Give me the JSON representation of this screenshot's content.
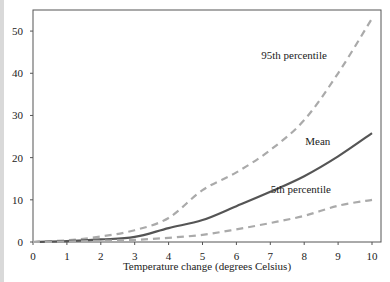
{
  "chart_data": {
    "type": "line",
    "title": "",
    "xlabel": "Temperature change (degrees Celsius)",
    "ylabel": "",
    "xlim": [
      0,
      10
    ],
    "ylim": [
      0,
      55
    ],
    "x_ticks": [
      0,
      1,
      2,
      3,
      4,
      5,
      6,
      7,
      8,
      9,
      10
    ],
    "y_ticks": [
      0,
      10,
      20,
      30,
      40,
      50
    ],
    "grid": false,
    "legend": "inline labels",
    "x": [
      0,
      1,
      2,
      3,
      4,
      5,
      6,
      7,
      8,
      9,
      10
    ],
    "series": [
      {
        "name": "95th percentile",
        "style": "dashed",
        "color": "#aaaaaa",
        "values": [
          0,
          0.4,
          1.3,
          2.8,
          5.7,
          12.3,
          16.5,
          21.8,
          28.9,
          40.0,
          53.0
        ]
      },
      {
        "name": "Mean",
        "style": "solid",
        "color": "#555555",
        "values": [
          0,
          0.2,
          0.6,
          1.2,
          3.3,
          5.2,
          8.5,
          11.9,
          15.6,
          20.3,
          25.8
        ]
      },
      {
        "name": "5th percentile",
        "style": "dashed",
        "color": "#aaaaaa",
        "values": [
          0,
          0.1,
          0.3,
          0.5,
          1.0,
          1.7,
          3.0,
          4.5,
          6.2,
          8.6,
          10.0
        ]
      }
    ],
    "annotations": [
      {
        "text": "95th percentile",
        "x": 7.7,
        "y": 43.5
      },
      {
        "text": "Mean",
        "x": 8.4,
        "y": 23.0
      },
      {
        "text": "5th percentile",
        "x": 7.9,
        "y": 11.5
      }
    ]
  }
}
